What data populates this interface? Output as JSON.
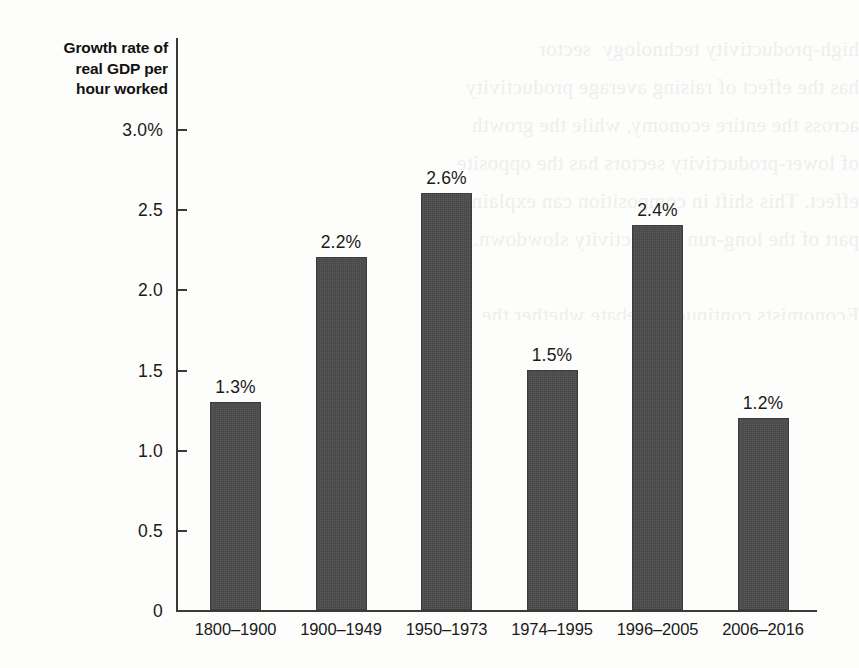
{
  "chart_data": {
    "type": "bar",
    "title": "Growth rate of real GDP per hour worked",
    "title_lines": [
      "Growth rate of",
      "real GDP per",
      "hour worked"
    ],
    "xlabel": "",
    "ylabel": "Growth rate of real GDP per hour worked",
    "categories": [
      "1800–1900",
      "1900–1949",
      "1950–1973",
      "1974–1995",
      "1996–2005",
      "2006–2016"
    ],
    "values": [
      1.3,
      2.2,
      2.6,
      1.5,
      2.4,
      1.2
    ],
    "value_labels": [
      "1.3%",
      "2.2%",
      "2.6%",
      "1.5%",
      "2.4%",
      "1.2%"
    ],
    "ylim": [
      0,
      3.0
    ],
    "ytick_values": [
      3.0,
      2.5,
      2.0,
      1.5,
      1.0,
      0.5,
      0
    ],
    "ytick_labels": [
      "3.0%",
      "2.5",
      "2.0",
      "1.5",
      "1.0",
      "0.5",
      "0"
    ],
    "grid": false,
    "legend": false,
    "bar_color": "#4a4a4a",
    "axis_color": "#3a3a3a"
  },
  "background": {
    "bleed_text": "high-productivity technology  sector\nhas the effect of raising average productivity\nacross the entire economy, while the growth\nof lower-productivity sectors has the opposite\neffect. This shift in composition can explain\npart of the long-run productivity slowdown.\n\nEconomists continue to debate whether the\nrecent slowdown will persist. The measured"
  }
}
